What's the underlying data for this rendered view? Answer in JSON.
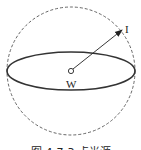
{
  "diagram": {
    "labels": {
      "intensity": "I",
      "center": "W"
    },
    "caption": "图 4-7-3  点光源",
    "colors": {
      "stroke": "#333333",
      "dashed": "#555555",
      "background": "#ffffff"
    },
    "shapes": {
      "sphere": {
        "cx": 71,
        "cy": 71,
        "r": 64,
        "style": "dashed"
      },
      "ellipse": {
        "cx": 71,
        "cy": 71,
        "rx": 64,
        "ry": 19,
        "style": "solid"
      },
      "center_point": {
        "cx": 71,
        "cy": 71,
        "r": 3
      },
      "arrow": {
        "x1": 71,
        "y1": 71,
        "x2": 122,
        "y2": 30
      }
    }
  }
}
